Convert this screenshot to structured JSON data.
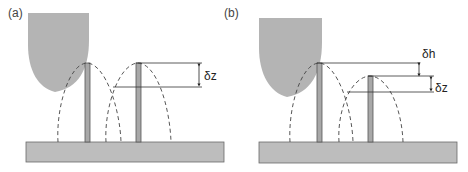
{
  "figure": {
    "panels": [
      {
        "id": "a",
        "label": "(a)",
        "dimension_labels": [
          "δz"
        ]
      },
      {
        "id": "b",
        "label": "(b)",
        "dimension_labels": [
          "δh",
          "δz"
        ]
      }
    ]
  },
  "colors": {
    "tip_fill": "#b4b4b4",
    "substrate_fill": "#bdbdbd",
    "substrate_stroke": "#6a6a6a",
    "pillar_fill": "#a8a8a8",
    "pillar_stroke": "#555555",
    "line": "#333333",
    "dashed": "#444444"
  }
}
